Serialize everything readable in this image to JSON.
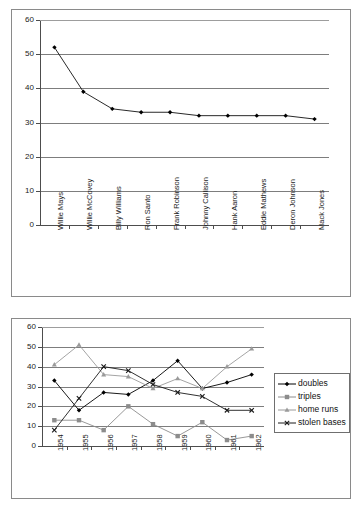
{
  "chart_data": [
    {
      "type": "line",
      "title": "",
      "xlabel": "",
      "ylabel": "",
      "ylim": [
        0,
        60
      ],
      "ytick_step": 10,
      "yticks": [
        "0",
        "10",
        "20",
        "30",
        "40",
        "50",
        "60"
      ],
      "grid": true,
      "legend": "none",
      "marker": "diamond",
      "categories": [
        "Willie Mays",
        "Willie McCovey",
        "Billy Williams",
        "Ron Santo",
        "Frank Robinson",
        "Johnny Callison",
        "Hank Aaron",
        "Eddie Mathews",
        "Deron Johnson",
        "Mack Jones"
      ],
      "values": [
        52,
        39,
        34,
        33,
        33,
        32,
        32,
        32,
        32,
        31
      ]
    },
    {
      "type": "line",
      "title": "",
      "xlabel": "",
      "ylabel": "",
      "ylim": [
        0,
        60
      ],
      "ytick_step": 10,
      "yticks": [
        "0",
        "10",
        "20",
        "30",
        "40",
        "50",
        "60"
      ],
      "grid": true,
      "legend": "right",
      "categories": [
        "1954",
        "1955",
        "1956",
        "1957",
        "1958",
        "1959",
        "1960",
        "1961",
        "1962"
      ],
      "series": [
        {
          "name": "doubles",
          "marker": "diamond",
          "color": "#000000",
          "values": [
            33,
            18,
            27,
            26,
            33,
            43,
            29,
            32,
            36
          ]
        },
        {
          "name": "triples",
          "marker": "square",
          "color": "#8c8c8c",
          "values": [
            13,
            13,
            8,
            20,
            11,
            5,
            12,
            3,
            5
          ]
        },
        {
          "name": "home runs",
          "marker": "triangle",
          "color": "#9a9a9a",
          "values": [
            41,
            51,
            36,
            35,
            29,
            34,
            29,
            40,
            49
          ]
        },
        {
          "name": "stolen bases",
          "marker": "x",
          "color": "#1a1a1a",
          "values": [
            8,
            24,
            40,
            38,
            31,
            27,
            25,
            18,
            18
          ]
        }
      ]
    }
  ],
  "colors": {
    "frame": "#8a8a8a",
    "gridline": "#7d7d7d",
    "axis": "#4d4d4d",
    "text": "#1a1a1a",
    "background": "#ffffff"
  }
}
